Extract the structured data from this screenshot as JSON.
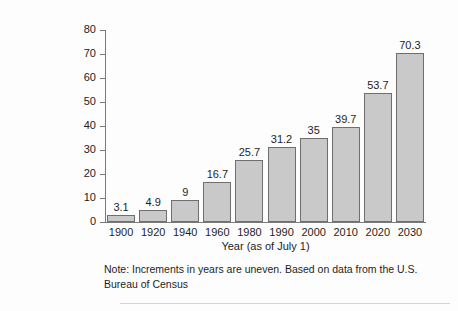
{
  "chart_data": {
    "type": "bar",
    "title": "",
    "subtitle": "",
    "xlabel": "Year (as of July 1)",
    "ylabel": "",
    "categories": [
      "1900",
      "1920",
      "1940",
      "1960",
      "1980",
      "1990",
      "2000",
      "2010",
      "2020",
      "2030"
    ],
    "values": [
      3.1,
      4.9,
      9,
      16.7,
      25.7,
      31.2,
      35,
      39.7,
      53.7,
      70.3
    ],
    "value_labels": [
      "3.1",
      "4.9",
      "9",
      "16.7",
      "25.7",
      "31.2",
      "35",
      "39.7",
      "53.7",
      "70.3"
    ],
    "ylim": [
      0,
      80
    ],
    "yticks": [
      0,
      10,
      20,
      30,
      40,
      50,
      60,
      70,
      80
    ],
    "ytick_labels": [
      "0",
      "10",
      "20",
      "30",
      "40",
      "50",
      "60",
      "70",
      "80"
    ],
    "grid": false,
    "legend": false,
    "legend_position": "none",
    "bar_color": "#c9c9c9",
    "bar_edge_color": "#6f6f6f",
    "axis_color": "#7a7a7a",
    "text_color": "#1d1d1d",
    "background_color": "#fdfdfd",
    "annotations": [
      "Note: Increments in years are uneven. Based on data from the U.S. Bureau of Census"
    ]
  },
  "note": {
    "line1": "Note: Increments in years are uneven. Based on data from the U.S.",
    "line2": "Bureau of Census"
  }
}
